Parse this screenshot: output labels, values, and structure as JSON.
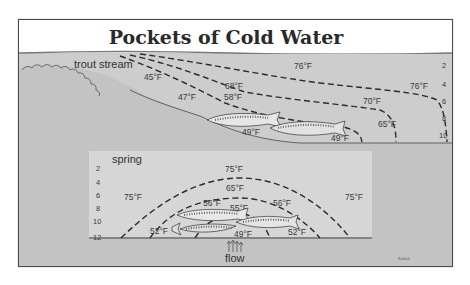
{
  "title": "Pockets of Cold Water",
  "colors": {
    "background": "#ffffff",
    "frame": "#4a4a4a",
    "water": "#c9c9c9",
    "bank": "#bdbdbd",
    "inset_panel": "#d6d6d6",
    "isotherm_line": "#2b2b2b",
    "text": "#333333"
  },
  "stream_panel": {
    "label": "trout stream",
    "depth_scale": [
      "2",
      "4",
      "6",
      "8",
      "10"
    ],
    "isotherms": {
      "surface_top": "76°F",
      "surface_right": "76°F",
      "mid_left": "68°F",
      "mid_right": "70°F",
      "cold_left": "58°F",
      "cold_right": "65°F",
      "bank_upper": "45°F",
      "bank_lower": "47°F",
      "fish_1": "49°F",
      "fish_2": "49°F"
    }
  },
  "spring_panel": {
    "label": "spring",
    "depth_scale": [
      "2",
      "4",
      "6",
      "8",
      "10",
      "12"
    ],
    "isotherms": {
      "top": "75°F",
      "left": "75°F",
      "right": "75°F",
      "outer_arc": "65°F",
      "middle_arc_left": "56°F",
      "middle_arc_right": "56°F",
      "inner_arc": "55°F",
      "bottom_left": "52°F",
      "bottom_right": "52°F",
      "source": "49°F"
    },
    "flow_label": "flow"
  },
  "signature": "Kelsch"
}
